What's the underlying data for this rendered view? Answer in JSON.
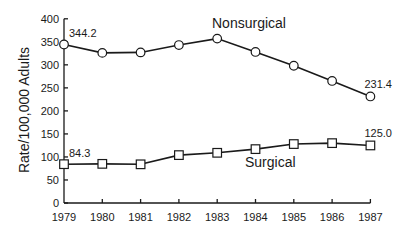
{
  "chart_data": {
    "type": "line",
    "title": "",
    "xlabel": "",
    "ylabel": "Rate/100,000 Adults",
    "ylim": [
      0,
      400
    ],
    "yticks": [
      0,
      50,
      100,
      150,
      200,
      250,
      300,
      350,
      400
    ],
    "ytick_labels": [
      "0",
      "50",
      "100",
      "150",
      "200",
      "250",
      "300",
      "350",
      "400"
    ],
    "categories": [
      "1979",
      "1980",
      "1981",
      "1982",
      "1983",
      "1984",
      "1985",
      "1986",
      "1987"
    ],
    "grid": false,
    "legend": "inline labels",
    "series": [
      {
        "name": "Nonsurgical",
        "marker": "circle",
        "values": [
          344.2,
          326,
          327,
          343,
          357,
          328,
          298,
          265,
          231.4
        ],
        "annotations": [
          {
            "index": 0,
            "text": "344.2"
          },
          {
            "index": 8,
            "text": "231.4"
          }
        ]
      },
      {
        "name": "Surgical",
        "marker": "square",
        "values": [
          84.3,
          85,
          84,
          104,
          109,
          117,
          128,
          130,
          125.0
        ],
        "annotations": [
          {
            "index": 0,
            "text": "84.3"
          },
          {
            "index": 8,
            "text": "125.0"
          }
        ]
      }
    ]
  }
}
